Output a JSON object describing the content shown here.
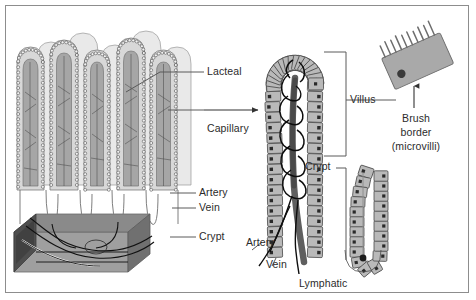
{
  "figure": {
    "border_color": "#8d8d8d",
    "background": "#ffffff"
  },
  "palette": {
    "epithelium_fill": "#b9b9b9",
    "epithelium_stroke": "#4a4a4a",
    "nucleus": "#2a2a2a",
    "villus_back_fill": "#e6e6e6",
    "villus_front_fill": "#d2d2d2",
    "core_fill": "#9a9a9a",
    "lymph_fill": "#5a5a5a",
    "vessel_stroke": "#111111",
    "base_block_dark": "#4c4c4c",
    "base_block_mid": "#6e6e6e",
    "brush_cell_fill": "#a8a8a8",
    "leader_line": "#5a5a5a",
    "text": "#2b2b2b"
  },
  "labels": {
    "lacteal": "Lacteal",
    "capillary": "Capillary",
    "artery_left": "Artery",
    "vein_left": "Vein",
    "crypt_left": "Crypt",
    "villus": "Villus",
    "crypt_right": "Crypt",
    "artery_center": "Artery",
    "vein_center": "Vein",
    "lymphatic": "Lymphatic",
    "brush_line1": "Brush",
    "brush_line2": "border",
    "brush_line3": "(microvilli)"
  },
  "panels": {
    "left": {
      "name": "villi-tissue-overview",
      "description": "Row of finger-like intestinal villi in cross-section with crypts and submucosal base block",
      "villi_count": 7
    },
    "center": {
      "name": "single-villus-magnified",
      "description": "Magnified single villus showing epithelium, central lacteal, capillary network, artery, vein and crypt"
    },
    "right": {
      "name": "brush-border-cell",
      "description": "Single absorptive epithelial cell with nucleus and microvilli forming the brush border"
    }
  },
  "connectors": {
    "magnify_arrow": "arrow-left-panel-to-center-panel",
    "brush_arrow": "arrow-up-to-microvilli",
    "villus_bracket": "bracket-villus-extent",
    "crypt_bracket": "bracket-crypt-extent"
  }
}
